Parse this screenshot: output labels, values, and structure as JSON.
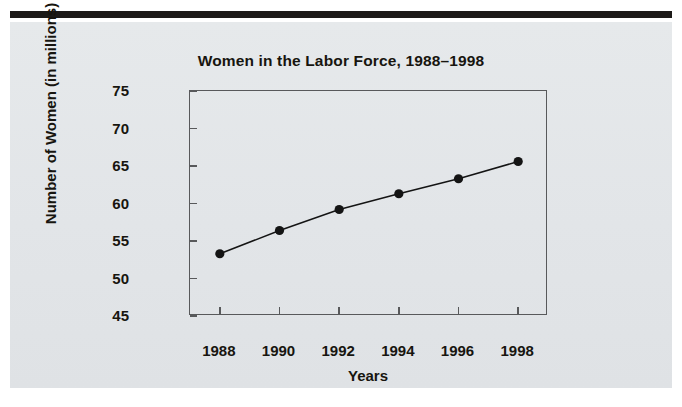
{
  "figure": {
    "background_color": "#e4e7e9",
    "rule_color": "#1c1a18"
  },
  "chart_data": {
    "type": "line",
    "title": "Women in the Labor Force, 1988–1998",
    "xlabel": "Years",
    "ylabel": "Number of Women (in millions)",
    "categories": [
      "1988",
      "1990",
      "1992",
      "1994",
      "1996",
      "1998"
    ],
    "x": [
      1988,
      1990,
      1992,
      1994,
      1996,
      1998
    ],
    "values": [
      53.3,
      56.4,
      59.2,
      61.3,
      63.3,
      65.6
    ],
    "xlim": [
      1987,
      1999
    ],
    "ylim": [
      45,
      75
    ],
    "yticks": [
      "45",
      "50",
      "55",
      "60",
      "65",
      "70",
      "75"
    ],
    "ytick_values": [
      45,
      50,
      55,
      60,
      65,
      70,
      75
    ],
    "xticks": [
      "1988",
      "1990",
      "1992",
      "1994",
      "1996",
      "1998"
    ],
    "grid": false,
    "legend": false,
    "series_color": "#141414",
    "marker": "circle",
    "frame_color": "#58595b"
  }
}
